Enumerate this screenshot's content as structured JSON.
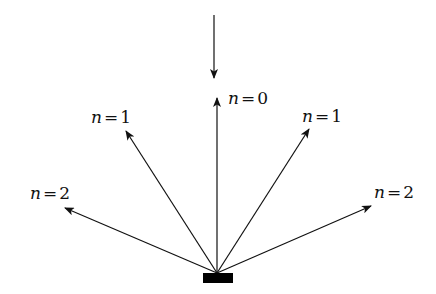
{
  "diagram": {
    "title": "",
    "colors": {
      "stroke": "#111111",
      "grating": "#000000",
      "background": "#ffffff"
    },
    "grating": {
      "x": 203,
      "y": 273,
      "width": 30,
      "height": 10
    },
    "origin": {
      "x": 217,
      "y": 273
    },
    "incident_beam": {
      "x1": 214,
      "y1": 15,
      "x2": 214,
      "y2": 78
    },
    "orders": [
      {
        "id": "n2-left",
        "var": "n",
        "eq": "=",
        "value": "2",
        "tip": {
          "x": 65,
          "y": 208
        },
        "label_pos": {
          "x": 30,
          "y": 183
        }
      },
      {
        "id": "n1-left",
        "var": "n",
        "eq": "=",
        "value": "1",
        "tip": {
          "x": 126,
          "y": 131
        },
        "label_pos": {
          "x": 91,
          "y": 107
        }
      },
      {
        "id": "n0",
        "var": "n",
        "eq": "=",
        "value": "0",
        "tip": {
          "x": 217,
          "y": 98
        },
        "label_pos": {
          "x": 228,
          "y": 88
        }
      },
      {
        "id": "n1-right",
        "var": "n",
        "eq": "=",
        "value": "1",
        "tip": {
          "x": 309,
          "y": 129
        },
        "label_pos": {
          "x": 302,
          "y": 106
        }
      },
      {
        "id": "n2-right",
        "var": "n",
        "eq": "=",
        "value": "2",
        "tip": {
          "x": 371,
          "y": 206
        },
        "label_pos": {
          "x": 374,
          "y": 182
        }
      }
    ]
  }
}
